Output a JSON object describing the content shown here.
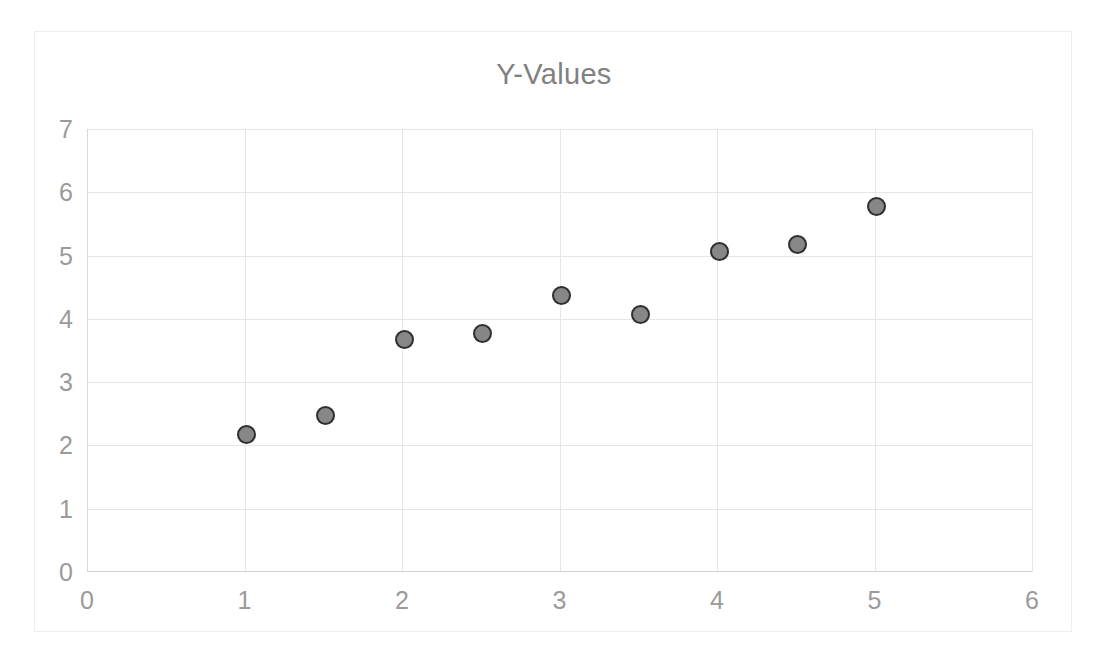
{
  "chart_data": {
    "type": "scatter",
    "title": "Y-Values",
    "xlabel": "",
    "ylabel": "",
    "xlim": [
      0,
      6
    ],
    "ylim": [
      0,
      7
    ],
    "x": [
      1,
      1.5,
      2,
      2.5,
      3,
      3.5,
      4,
      4.5,
      5
    ],
    "values": [
      2.2,
      2.5,
      3.7,
      3.8,
      4.4,
      4.1,
      5.1,
      5.2,
      5.8
    ],
    "series": [
      {
        "name": "Y-Values",
        "points": [
          {
            "x": 1,
            "y": 2.2
          },
          {
            "x": 1.5,
            "y": 2.5
          },
          {
            "x": 2,
            "y": 3.7
          },
          {
            "x": 2.5,
            "y": 3.8
          },
          {
            "x": 3,
            "y": 4.4
          },
          {
            "x": 3.5,
            "y": 4.1
          },
          {
            "x": 4,
            "y": 5.1
          },
          {
            "x": 4.5,
            "y": 5.2
          },
          {
            "x": 5,
            "y": 5.8
          }
        ]
      }
    ],
    "x_ticks": [
      "0",
      "1",
      "2",
      "3",
      "4",
      "5",
      "6"
    ],
    "x_tick_values": [
      0,
      1,
      2,
      3,
      4,
      5,
      6
    ],
    "y_ticks": [
      "0",
      "1",
      "2",
      "3",
      "4",
      "5",
      "6",
      "7"
    ],
    "y_tick_values": [
      0,
      1,
      2,
      3,
      4,
      5,
      6,
      7
    ],
    "grid": true,
    "legend": false,
    "legend_position": "none",
    "marker_fill_color": "#878787",
    "marker_edge_color": "#2f2f2f",
    "gridline_color": "#e6e6e6",
    "tick_label_color": "#9a9a9a",
    "title_color": "#818181",
    "plot_background_color": "#ffffff",
    "frame_border_color": "#eeeeee"
  }
}
